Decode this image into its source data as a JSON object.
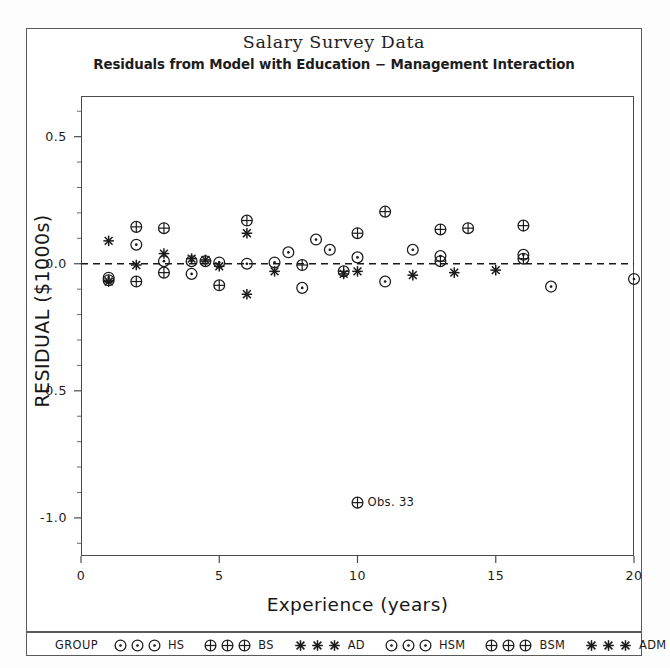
{
  "chart_data": {
    "type": "scatter",
    "title": "Salary Survey Data",
    "subtitle": "Residuals from Model with Education − Management Interaction",
    "xlabel": "Experience (years)",
    "ylabel": "RESIDUAL ($1000s)",
    "xlim": [
      0,
      20
    ],
    "ylim": [
      -1.15,
      0.66
    ],
    "grid": false,
    "reference_line": {
      "y": 0.0,
      "style": "dashed"
    },
    "xticks": [
      "0",
      "5",
      "10",
      "15",
      "20"
    ],
    "xtick_values": [
      0,
      5,
      10,
      15,
      20
    ],
    "yticks": [
      "0.5",
      "0.0",
      "-0.5",
      "-1.0"
    ],
    "ytick_values": [
      0.5,
      0.0,
      -0.5,
      -1.0
    ],
    "legend_position": "bottom",
    "legend_title": "GROUP",
    "series": [
      {
        "name": "HS",
        "symbol": "circle-dot",
        "values": [
          [
            1,
            -0.055
          ],
          [
            1,
            -0.065
          ],
          [
            2,
            0.075
          ],
          [
            2,
            -0.035
          ],
          [
            3,
            0.03
          ],
          [
            3,
            -0.04
          ],
          [
            4,
            0.01
          ],
          [
            4,
            -0.005
          ],
          [
            5,
            -0.02
          ],
          [
            6,
            0.0
          ],
          [
            7.5,
            0.045
          ],
          [
            8,
            0.095
          ],
          [
            9,
            -0.03
          ],
          [
            10,
            0.025
          ],
          [
            11,
            -0.07
          ],
          [
            12,
            0.055
          ],
          [
            13,
            0.0
          ],
          [
            16,
            0.035
          ],
          [
            20,
            -0.06
          ]
        ]
      },
      {
        "name": "BS",
        "symbol": "circle-plus",
        "values": [
          [
            2,
            0.145
          ],
          [
            2,
            -0.07
          ],
          [
            3,
            0.14
          ],
          [
            3,
            -0.03
          ],
          [
            4,
            -0.005
          ],
          [
            5,
            0.0
          ],
          [
            6,
            0.17
          ],
          [
            6,
            -0.075
          ],
          [
            7,
            0.0
          ],
          [
            10,
            0.12
          ],
          [
            10,
            -0.04
          ],
          [
            11,
            0.205
          ],
          [
            12,
            0.055
          ],
          [
            13,
            0.135
          ],
          [
            14,
            0.14
          ],
          [
            16,
            0.15
          ],
          [
            16,
            -0.04
          ],
          [
            10,
            -0.94
          ]
        ]
      },
      {
        "name": "AD",
        "symbol": "star",
        "values": [
          [
            1,
            0.09
          ],
          [
            1,
            -0.07
          ],
          [
            2,
            -0.06
          ],
          [
            3,
            0.04
          ],
          [
            4,
            0.015
          ],
          [
            4,
            0.01
          ],
          [
            5,
            -0.005
          ],
          [
            6,
            0.12
          ],
          [
            6,
            -0.12
          ],
          [
            7,
            -0.03
          ],
          [
            9,
            -0.035
          ],
          [
            10,
            -0.025
          ],
          [
            12,
            -0.045
          ],
          [
            13,
            -0.035
          ],
          [
            15,
            -0.025
          ]
        ]
      },
      {
        "name": "HSM",
        "symbol": "circle-dot",
        "values": []
      },
      {
        "name": "BSM",
        "symbol": "circle-plus",
        "values": []
      },
      {
        "name": "ADM",
        "symbol": "star",
        "values": []
      }
    ],
    "points": [
      {
        "x": 1,
        "y": 0.09,
        "sym": "star"
      },
      {
        "x": 1,
        "y": -0.055,
        "sym": "circle-dot"
      },
      {
        "x": 1,
        "y": -0.065,
        "sym": "circle-plus"
      },
      {
        "x": 1,
        "y": -0.07,
        "sym": "star"
      },
      {
        "x": 2,
        "y": 0.145,
        "sym": "circle-plus"
      },
      {
        "x": 2,
        "y": 0.075,
        "sym": "circle-dot"
      },
      {
        "x": 2,
        "y": -0.005,
        "sym": "star"
      },
      {
        "x": 2,
        "y": -0.07,
        "sym": "circle-plus"
      },
      {
        "x": 3,
        "y": 0.14,
        "sym": "circle-plus"
      },
      {
        "x": 3,
        "y": 0.04,
        "sym": "star"
      },
      {
        "x": 3,
        "y": 0.01,
        "sym": "circle-dot"
      },
      {
        "x": 3,
        "y": -0.035,
        "sym": "circle-plus"
      },
      {
        "x": 4,
        "y": 0.02,
        "sym": "star"
      },
      {
        "x": 4,
        "y": 0.01,
        "sym": "circle-dot"
      },
      {
        "x": 4,
        "y": -0.04,
        "sym": "circle-dot"
      },
      {
        "x": 4.5,
        "y": 0.015,
        "sym": "star"
      },
      {
        "x": 4.5,
        "y": 0.01,
        "sym": "circle-plus"
      },
      {
        "x": 5,
        "y": 0.005,
        "sym": "circle-dot"
      },
      {
        "x": 5,
        "y": -0.01,
        "sym": "star"
      },
      {
        "x": 5,
        "y": -0.085,
        "sym": "circle-plus"
      },
      {
        "x": 6,
        "y": 0.17,
        "sym": "circle-plus"
      },
      {
        "x": 6,
        "y": 0.12,
        "sym": "star"
      },
      {
        "x": 6,
        "y": 0.0,
        "sym": "circle-dot"
      },
      {
        "x": 6,
        "y": -0.12,
        "sym": "star"
      },
      {
        "x": 7,
        "y": 0.005,
        "sym": "circle-dot"
      },
      {
        "x": 7,
        "y": -0.03,
        "sym": "star"
      },
      {
        "x": 7.5,
        "y": 0.045,
        "sym": "circle-dot"
      },
      {
        "x": 8,
        "y": -0.005,
        "sym": "circle-plus"
      },
      {
        "x": 8,
        "y": -0.095,
        "sym": "circle-dot"
      },
      {
        "x": 8.5,
        "y": 0.095,
        "sym": "circle-dot"
      },
      {
        "x": 9,
        "y": 0.055,
        "sym": "circle-dot"
      },
      {
        "x": 9.5,
        "y": -0.03,
        "sym": "circle-plus"
      },
      {
        "x": 9.5,
        "y": -0.04,
        "sym": "star"
      },
      {
        "x": 10,
        "y": 0.12,
        "sym": "circle-plus"
      },
      {
        "x": 10,
        "y": 0.025,
        "sym": "circle-dot"
      },
      {
        "x": 10,
        "y": -0.03,
        "sym": "star"
      },
      {
        "x": 10,
        "y": -0.94,
        "sym": "circle-plus"
      },
      {
        "x": 11,
        "y": 0.205,
        "sym": "circle-plus"
      },
      {
        "x": 11,
        "y": -0.07,
        "sym": "circle-dot"
      },
      {
        "x": 12,
        "y": 0.055,
        "sym": "circle-dot"
      },
      {
        "x": 12,
        "y": -0.045,
        "sym": "star"
      },
      {
        "x": 13,
        "y": 0.135,
        "sym": "circle-plus"
      },
      {
        "x": 13,
        "y": 0.03,
        "sym": "circle-dot"
      },
      {
        "x": 13,
        "y": 0.01,
        "sym": "circle-plus"
      },
      {
        "x": 13.5,
        "y": -0.035,
        "sym": "star"
      },
      {
        "x": 14,
        "y": 0.14,
        "sym": "circle-plus"
      },
      {
        "x": 15,
        "y": -0.025,
        "sym": "star"
      },
      {
        "x": 16,
        "y": 0.15,
        "sym": "circle-plus"
      },
      {
        "x": 16,
        "y": 0.035,
        "sym": "circle-dot"
      },
      {
        "x": 16,
        "y": 0.02,
        "sym": "circle-plus"
      },
      {
        "x": 17,
        "y": -0.09,
        "sym": "circle-dot"
      },
      {
        "x": 20,
        "y": -0.06,
        "sym": "circle-dot"
      }
    ],
    "annotations": [
      {
        "text": "Obs. 33",
        "x": 10,
        "y": -0.94,
        "symbol": "circle-plus"
      }
    ]
  },
  "legend": {
    "title": "GROUP",
    "entries": [
      {
        "label": "HS",
        "symbol": "circle-dot"
      },
      {
        "label": "BS",
        "symbol": "circle-plus"
      },
      {
        "label": "AD",
        "symbol": "star"
      },
      {
        "label": "HSM",
        "symbol": "circle-dot"
      },
      {
        "label": "BSM",
        "symbol": "circle-plus"
      },
      {
        "label": "ADM",
        "symbol": "star"
      }
    ]
  },
  "colors": {
    "foreground": "#1a1a1a",
    "frame": "#4a4a4a",
    "background": "#ffffff"
  }
}
